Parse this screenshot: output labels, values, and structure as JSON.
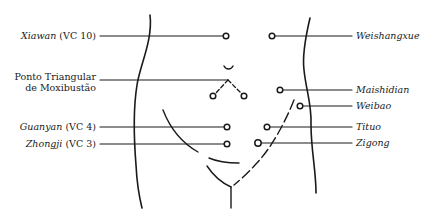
{
  "diagram": {
    "type": "acupuncture-point-chart",
    "line_color": "#1a1a1a",
    "left_labels": [
      {
        "name": "Xiawan",
        "suffix": " (VC 10)",
        "italic_name": true
      },
      {
        "name": "Ponto Triangular",
        "line2": "de Moxibustão",
        "italic_name": false
      },
      {
        "name": "Guanyan",
        "suffix": " (VC 4)",
        "italic_name": true
      },
      {
        "name": "Zhongji",
        "suffix": " (VC 3)",
        "italic_name": true
      }
    ],
    "right_labels": [
      {
        "name": "Weishangxue"
      },
      {
        "name": "Maishidian"
      },
      {
        "name": "Weibao"
      },
      {
        "name": "Tituo"
      },
      {
        "name": "Zigong"
      }
    ]
  }
}
